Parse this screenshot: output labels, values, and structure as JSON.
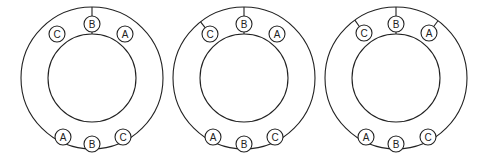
{
  "diagrams": [
    {
      "center": [
        92,
        78
      ],
      "outer_r": 71,
      "inner_r": 44,
      "top_labels": [
        {
          "text": "C",
          "x": 57,
          "y": 34,
          "connected_outer": false
        },
        {
          "text": "B",
          "x": 92,
          "y": 24,
          "connected_outer": true,
          "connected_inner": true
        },
        {
          "text": "A",
          "x": 125,
          "y": 34,
          "connected_outer": false
        }
      ],
      "bottom_labels": [
        {
          "text": "A",
          "x": 63,
          "y": 137
        },
        {
          "text": "B",
          "x": 92,
          "y": 144
        },
        {
          "text": "C",
          "x": 123,
          "y": 137
        }
      ]
    },
    {
      "center": [
        244,
        78
      ],
      "outer_r": 71,
      "inner_r": 44,
      "top_labels": [
        {
          "text": "C",
          "x": 210,
          "y": 34,
          "connected_outer": true
        },
        {
          "text": "B",
          "x": 244,
          "y": 24,
          "connected_outer": true,
          "connected_inner": true
        },
        {
          "text": "A",
          "x": 277,
          "y": 34,
          "connected_outer": false
        }
      ],
      "bottom_labels": [
        {
          "text": "A",
          "x": 213,
          "y": 137
        },
        {
          "text": "B",
          "x": 244,
          "y": 144
        },
        {
          "text": "C",
          "x": 275,
          "y": 137
        }
      ]
    },
    {
      "center": [
        396,
        78
      ],
      "outer_r": 71,
      "inner_r": 44,
      "top_labels": [
        {
          "text": "C",
          "x": 364,
          "y": 33,
          "connected_outer": true
        },
        {
          "text": "B",
          "x": 396,
          "y": 24,
          "connected_outer": true,
          "connected_inner": true
        },
        {
          "text": "A",
          "x": 429,
          "y": 33,
          "connected_outer": true
        }
      ],
      "bottom_labels": [
        {
          "text": "A",
          "x": 366,
          "y": 137
        },
        {
          "text": "B",
          "x": 396,
          "y": 144
        },
        {
          "text": "C",
          "x": 428,
          "y": 137
        }
      ]
    }
  ],
  "label_radius": 8,
  "stroke_color": "#222222"
}
